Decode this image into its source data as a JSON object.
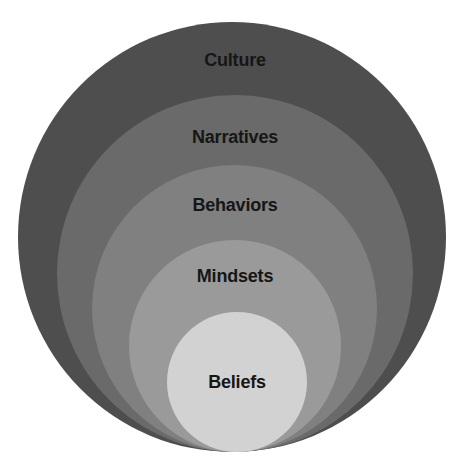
{
  "diagram": {
    "type": "nested-circles",
    "layers": [
      {
        "label": "Culture",
        "color": "#4e4e4e",
        "level": 1
      },
      {
        "label": "Narratives",
        "color": "#6a6a6a",
        "level": 2
      },
      {
        "label": "Behaviors",
        "color": "#808080",
        "level": 3
      },
      {
        "label": "Mindsets",
        "color": "#9a9a9a",
        "level": 4
      },
      {
        "label": "Beliefs",
        "color": "#d2d2d2",
        "level": 5
      }
    ],
    "text_color": "#161616"
  }
}
